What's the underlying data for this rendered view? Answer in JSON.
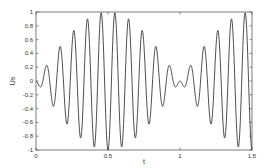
{
  "chart_data": {
    "type": "line",
    "title": "",
    "xlabel": "t",
    "ylabel": "Us",
    "xlim": [
      0,
      1.5
    ],
    "ylim": [
      -1,
      1
    ],
    "xticks": [
      0,
      0.5,
      1,
      1.5
    ],
    "xtick_labels": [
      "0",
      "0.5",
      "1",
      "1.5"
    ],
    "yticks": [
      -1,
      -0.8,
      -0.6,
      -0.4,
      -0.2,
      0,
      0.2,
      0.4,
      0.6,
      0.8,
      1
    ],
    "ytick_labels": [
      "-1",
      "-0.8",
      "-0.6",
      "-0.4",
      "-0.2",
      "0",
      "0.2",
      "0.4",
      "0.6",
      "0.8",
      "1"
    ],
    "grid": false,
    "legend": null,
    "line_color": "#222222",
    "extrema": {
      "x": [
        0.03,
        0.076,
        0.124,
        0.171,
        0.219,
        0.267,
        0.314,
        0.362,
        0.41,
        0.457,
        0.505,
        0.552,
        0.6,
        0.648,
        0.695,
        0.743,
        0.79,
        0.838,
        0.886,
        0.933,
        0.97,
        1.0,
        1.03,
        1.067,
        1.114,
        1.162,
        1.21,
        1.257,
        1.305,
        1.352,
        1.4,
        1.448,
        1.495
      ],
      "y": [
        -0.09,
        0.23,
        -0.37,
        0.49,
        -0.6,
        0.74,
        -0.83,
        0.91,
        -0.96,
        0.99,
        -1.0,
        0.99,
        -0.95,
        0.9,
        -0.82,
        0.72,
        -0.6,
        0.48,
        -0.35,
        0.21,
        -0.09,
        0.0,
        -0.09,
        0.21,
        -0.35,
        0.48,
        -0.6,
        0.72,
        -0.82,
        0.9,
        -0.95,
        0.99,
        -1.0
      ]
    },
    "series": [
      {
        "name": "Us",
        "formula": "-sin(pi*t)*sin(21*pi*t)",
        "t_start": 0,
        "t_end": 1.5,
        "samples": 900
      }
    ]
  }
}
